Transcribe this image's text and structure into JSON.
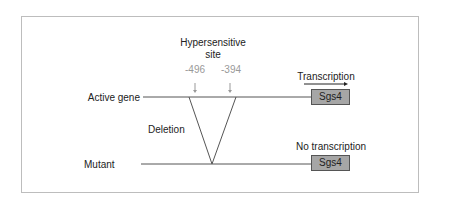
{
  "diagram": {
    "hypersensitive_label_line1": "Hypersensitive",
    "hypersensitive_label_line2": "site",
    "positions": [
      "-496",
      "-394"
    ],
    "active_row": {
      "label": "Active gene",
      "gene": "Sgs4",
      "annotation": "Transcription"
    },
    "mutant_row": {
      "label": "Mutant",
      "gene": "Sgs4",
      "annotation": "No transcription"
    },
    "deletion_label": "Deletion",
    "colors": {
      "gene_box": "#a6a6a6",
      "line": "#555555",
      "frame": "#bdbdbd",
      "position_text": "#999999"
    }
  }
}
